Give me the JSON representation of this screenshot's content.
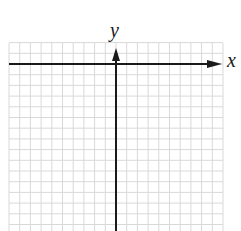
{
  "diagram": {
    "type": "coordinate-grid",
    "axes": {
      "x_label": "x",
      "y_label": "y",
      "x_arrow": "positive-direction-only",
      "y_arrow": "positive-direction-only"
    },
    "grid": {
      "left_px": 9,
      "right_px": 223,
      "top_px": 43,
      "bottom_px": 231,
      "cell_px": 10.7,
      "columns": 20,
      "line_color": "#d9d9d9"
    },
    "origin_px": {
      "x": 116,
      "y": 64
    },
    "axis_color": "#1a1a1a"
  }
}
